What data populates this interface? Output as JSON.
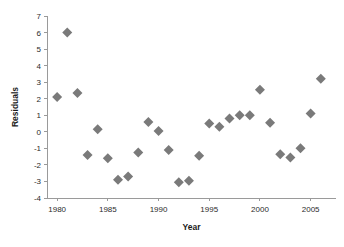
{
  "chart_data": {
    "type": "scatter",
    "title": "",
    "xlabel": "Year",
    "ylabel": "Residuals",
    "xlim": [
      1979,
      2007.5
    ],
    "ylim": [
      -4,
      7
    ],
    "grid": false,
    "legend": false,
    "marker": {
      "shape": "diamond",
      "color": "#7a7a7a",
      "size": 5
    },
    "xticks": [
      1980,
      1985,
      1990,
      1995,
      2000,
      2005
    ],
    "xtick_labels": [
      "1980",
      "1985",
      "1990",
      "1995",
      "2000",
      "2005"
    ],
    "yticks": [
      -4,
      -3,
      -2,
      -1,
      0,
      1,
      2,
      3,
      4,
      5,
      6,
      7
    ],
    "ytick_labels": [
      "-4",
      "-3",
      "-2",
      "-1",
      "0",
      "1",
      "2",
      "3",
      "4",
      "5",
      "6",
      "7"
    ],
    "x": [
      1980,
      1981,
      1982,
      1983,
      1984,
      1985,
      1986,
      1987,
      1988,
      1989,
      1990,
      1991,
      1992,
      1993,
      1994,
      1995,
      1996,
      1997,
      1998,
      1999,
      2000,
      2001,
      2002,
      2003,
      2004,
      2005,
      2006
    ],
    "y": [
      2.1,
      6.0,
      2.35,
      -1.4,
      0.15,
      -1.6,
      -2.9,
      -2.7,
      -1.25,
      0.6,
      0.05,
      -1.1,
      -3.05,
      -2.95,
      -1.45,
      0.5,
      0.3,
      0.8,
      1.0,
      1.0,
      2.55,
      0.55,
      -1.35,
      -1.55,
      -1.0,
      1.1,
      3.2
    ],
    "points": [
      {
        "x": 1980,
        "y": 2.1
      },
      {
        "x": 1981,
        "y": 6.0
      },
      {
        "x": 1982,
        "y": 2.35
      },
      {
        "x": 1983,
        "y": -1.4
      },
      {
        "x": 1984,
        "y": 0.15
      },
      {
        "x": 1985,
        "y": -1.6
      },
      {
        "x": 1986,
        "y": -2.9
      },
      {
        "x": 1987,
        "y": -2.7
      },
      {
        "x": 1988,
        "y": -1.25
      },
      {
        "x": 1989,
        "y": 0.6
      },
      {
        "x": 1990,
        "y": 0.05
      },
      {
        "x": 1991,
        "y": -1.1
      },
      {
        "x": 1992,
        "y": -3.05
      },
      {
        "x": 1993,
        "y": -2.95
      },
      {
        "x": 1994,
        "y": -1.45
      },
      {
        "x": 1995,
        "y": 0.5
      },
      {
        "x": 1996,
        "y": 0.3
      },
      {
        "x": 1997,
        "y": 0.8
      },
      {
        "x": 1998,
        "y": 1.0
      },
      {
        "x": 1999,
        "y": 1.0
      },
      {
        "x": 2000,
        "y": 2.55
      },
      {
        "x": 2001,
        "y": 0.55
      },
      {
        "x": 2002,
        "y": -1.35
      },
      {
        "x": 2003,
        "y": -1.55
      },
      {
        "x": 2004,
        "y": -1.0
      },
      {
        "x": 2005,
        "y": 1.1
      },
      {
        "x": 2006,
        "y": 3.2
      }
    ]
  }
}
